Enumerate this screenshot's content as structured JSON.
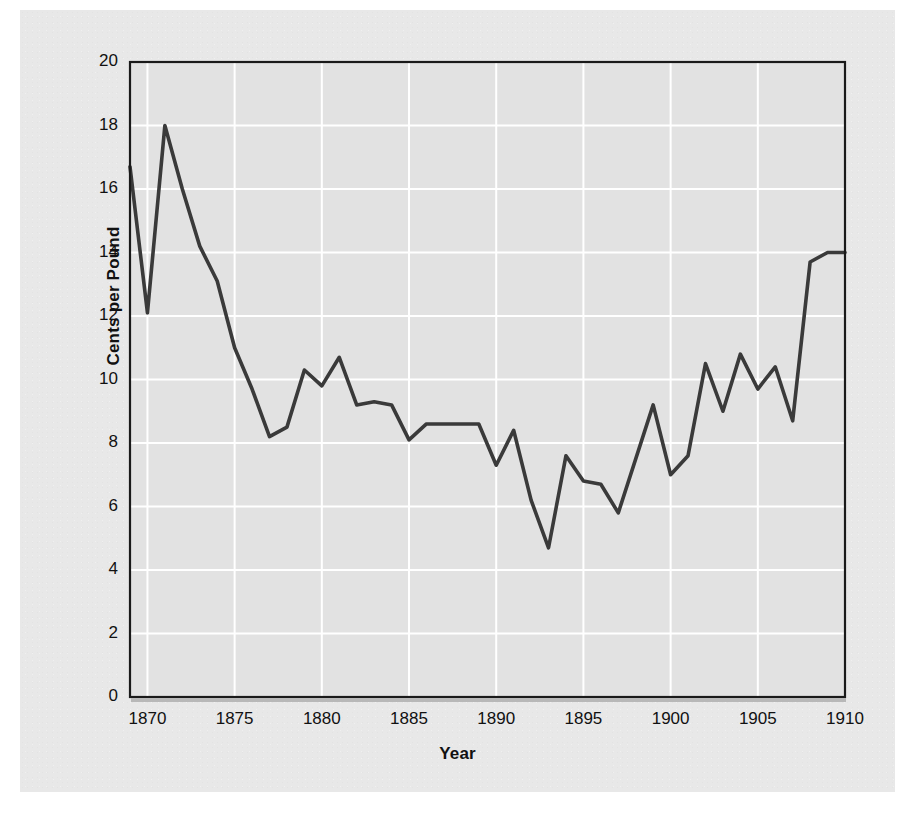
{
  "figure": {
    "background_color": "#e8e8e8",
    "page_color": "#ffffff",
    "plot_background_color": "#e2e2e2",
    "gridline_color": "#ffffff",
    "axis_color": "#1a1a1a",
    "line_color": "#3a3a3a"
  },
  "axis_titles": {
    "x": "Year",
    "y": "Cents per Pound"
  },
  "ticks": {
    "x": [
      "1870",
      "1875",
      "1880",
      "1885",
      "1890",
      "1895",
      "1900",
      "1905",
      "1910"
    ],
    "y": [
      "0",
      "2",
      "4",
      "6",
      "8",
      "10",
      "12",
      "14",
      "16",
      "18",
      "20"
    ]
  },
  "chart_data": {
    "type": "line",
    "title": "",
    "xlabel": "Year",
    "ylabel": "Cents per Pound",
    "xlim": [
      1869,
      1910
    ],
    "ylim": [
      0,
      20
    ],
    "xticks": [
      1870,
      1875,
      1880,
      1885,
      1890,
      1895,
      1900,
      1905,
      1910
    ],
    "yticks": [
      0,
      2,
      4,
      6,
      8,
      10,
      12,
      14,
      16,
      18,
      20
    ],
    "grid": true,
    "legend": false,
    "x": [
      1869,
      1870,
      1871,
      1872,
      1873,
      1874,
      1875,
      1876,
      1877,
      1878,
      1879,
      1880,
      1881,
      1882,
      1883,
      1884,
      1885,
      1886,
      1887,
      1888,
      1889,
      1890,
      1891,
      1892,
      1893,
      1894,
      1895,
      1896,
      1897,
      1898,
      1899,
      1900,
      1901,
      1902,
      1903,
      1904,
      1905,
      1906,
      1907,
      1908,
      1909,
      1910
    ],
    "values": [
      16.7,
      12.1,
      18.0,
      16.0,
      14.2,
      13.1,
      11.0,
      9.7,
      8.2,
      8.5,
      10.3,
      9.8,
      10.7,
      9.2,
      9.3,
      9.2,
      8.1,
      8.6,
      8.6,
      8.6,
      8.6,
      7.3,
      8.4,
      6.2,
      4.7,
      7.6,
      6.8,
      6.7,
      5.8,
      7.5,
      9.2,
      7.0,
      7.6,
      10.5,
      9.0,
      10.8,
      9.7,
      10.4,
      8.7,
      13.7,
      14.0,
      14.0
    ],
    "series": [
      {
        "name": "Cotton price",
        "values": [
          16.7,
          12.1,
          18.0,
          16.0,
          14.2,
          13.1,
          11.0,
          9.7,
          8.2,
          8.5,
          10.3,
          9.8,
          10.7,
          9.2,
          9.3,
          9.2,
          8.1,
          8.6,
          8.6,
          8.6,
          8.6,
          7.3,
          8.4,
          6.2,
          4.7,
          7.6,
          6.8,
          6.7,
          5.8,
          7.5,
          9.2,
          7.0,
          7.6,
          10.5,
          9.0,
          10.8,
          9.7,
          10.4,
          8.7,
          13.7,
          14.0,
          14.0
        ]
      }
    ]
  }
}
